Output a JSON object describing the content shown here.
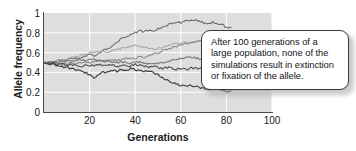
{
  "chart_data": {
    "type": "line",
    "title": "",
    "xlabel": "Generations",
    "ylabel": "Allele frequency",
    "xlim": [
      0,
      100
    ],
    "ylim": [
      0,
      1
    ],
    "grid": true,
    "grid_color": "#ffffff",
    "plot_background": "#dedede",
    "legend": "none",
    "x_ticks": [
      20,
      40,
      60,
      80,
      100
    ],
    "x_tick_labels": [
      "20",
      "40",
      "60",
      "80",
      "100"
    ],
    "y_ticks": [
      0,
      0.2,
      0.4,
      0.6,
      0.8,
      1
    ],
    "y_tick_labels": [
      "0",
      "0.2",
      "0.4",
      "0.6",
      "0.8",
      "1"
    ],
    "note": "Six genetic-drift simulation replicates, all starting at allele frequency 0.5; drawn to generation ~82 where the callout box overlays the plot.",
    "x": [
      0,
      2,
      4,
      6,
      8,
      10,
      12,
      14,
      16,
      18,
      20,
      22,
      24,
      26,
      28,
      30,
      32,
      34,
      36,
      38,
      40,
      42,
      44,
      46,
      48,
      50,
      52,
      54,
      56,
      58,
      60,
      62,
      64,
      66,
      68,
      70,
      72,
      74,
      76,
      78,
      80,
      82
    ],
    "series": [
      {
        "name": "replicate-1",
        "color": "#6e6e6e",
        "values": [
          0.5,
          0.51,
          0.5,
          0.52,
          0.53,
          0.52,
          0.54,
          0.55,
          0.54,
          0.56,
          0.58,
          0.57,
          0.6,
          0.62,
          0.64,
          0.66,
          0.7,
          0.74,
          0.76,
          0.79,
          0.8,
          0.82,
          0.81,
          0.83,
          0.82,
          0.84,
          0.86,
          0.88,
          0.9,
          0.91,
          0.9,
          0.92,
          0.93,
          0.93,
          0.92,
          0.9,
          0.89,
          0.91,
          0.9,
          0.88,
          0.86,
          0.85
        ]
      },
      {
        "name": "replicate-2",
        "color": "#a8a8a8",
        "values": [
          0.5,
          0.5,
          0.51,
          0.52,
          0.51,
          0.53,
          0.55,
          0.56,
          0.57,
          0.58,
          0.6,
          0.61,
          0.6,
          0.62,
          0.61,
          0.62,
          0.63,
          0.64,
          0.65,
          0.66,
          0.67,
          0.66,
          0.65,
          0.64,
          0.63,
          0.64,
          0.65,
          0.67,
          0.68,
          0.69,
          0.7,
          0.71,
          0.7,
          0.71,
          0.72,
          0.71,
          0.7,
          0.71,
          0.7,
          0.69,
          0.68,
          0.67
        ]
      },
      {
        "name": "replicate-3",
        "color": "#8a8a8a",
        "values": [
          0.5,
          0.49,
          0.5,
          0.49,
          0.48,
          0.49,
          0.5,
          0.49,
          0.5,
          0.51,
          0.5,
          0.51,
          0.52,
          0.51,
          0.52,
          0.53,
          0.52,
          0.53,
          0.54,
          0.55,
          0.54,
          0.56,
          0.55,
          0.57,
          0.58,
          0.6,
          0.62,
          0.63,
          0.65,
          0.66,
          0.68,
          0.69,
          0.7,
          0.71,
          0.72,
          0.71,
          0.72,
          0.73,
          0.72,
          0.71,
          0.72,
          0.71
        ]
      },
      {
        "name": "replicate-4",
        "color": "#787878",
        "values": [
          0.5,
          0.5,
          0.51,
          0.5,
          0.51,
          0.52,
          0.51,
          0.52,
          0.53,
          0.52,
          0.54,
          0.53,
          0.52,
          0.51,
          0.52,
          0.51,
          0.5,
          0.51,
          0.5,
          0.49,
          0.5,
          0.51,
          0.5,
          0.49,
          0.48,
          0.49,
          0.5,
          0.51,
          0.52,
          0.53,
          0.54,
          0.55,
          0.56,
          0.55,
          0.54,
          0.53,
          0.52,
          0.51,
          0.5,
          0.49,
          0.48,
          0.47
        ]
      },
      {
        "name": "replicate-5",
        "color": "#4f4f4f",
        "values": [
          0.5,
          0.49,
          0.5,
          0.48,
          0.49,
          0.47,
          0.48,
          0.47,
          0.46,
          0.47,
          0.46,
          0.47,
          0.48,
          0.47,
          0.48,
          0.47,
          0.46,
          0.47,
          0.46,
          0.47,
          0.48,
          0.47,
          0.46,
          0.45,
          0.46,
          0.45,
          0.44,
          0.45,
          0.44,
          0.43,
          0.44,
          0.43,
          0.44,
          0.45,
          0.44,
          0.45,
          0.44,
          0.45,
          0.44,
          0.45,
          0.44,
          0.45
        ]
      },
      {
        "name": "replicate-6",
        "color": "#3a3a3a",
        "values": [
          0.5,
          0.49,
          0.48,
          0.47,
          0.46,
          0.45,
          0.44,
          0.43,
          0.42,
          0.4,
          0.38,
          0.34,
          0.38,
          0.4,
          0.41,
          0.42,
          0.41,
          0.43,
          0.42,
          0.44,
          0.43,
          0.42,
          0.41,
          0.42,
          0.4,
          0.38,
          0.35,
          0.32,
          0.3,
          0.28,
          0.27,
          0.26,
          0.27,
          0.26,
          0.25,
          0.24,
          0.23,
          0.24,
          0.23,
          0.22,
          0.21,
          0.22
        ]
      }
    ]
  },
  "callout": {
    "text": "After 100 generations of a large population, none of the simulations result in extinction or fixation of the allele."
  }
}
